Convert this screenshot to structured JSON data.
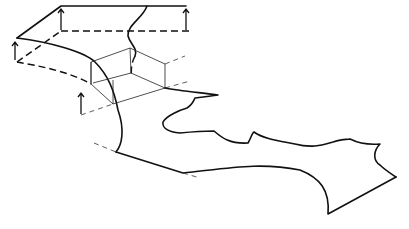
{
  "diagram": {
    "title": "",
    "stroke_color": "#111111",
    "background": "#ffffff",
    "elements": {
      "top_layer_outline": "M61,6 L186,6 M61,6 L17,38",
      "top_layer_dashed": "M61,31 L190,31 M17,62 L61,31",
      "front_edge_curve": "M17,38 C50,42 85,52 95,62 C108,75 114,90 118,110 C125,130 122,145 116,152",
      "front_edge_dashed": "M17,62 C40,66 70,72 91,84",
      "winding_river": "M147,6 C143,18 127,25 128,36 C130,44 138,48 135,56",
      "river_dashed": "M135,56 C130,66 132,70 131,74",
      "box_thin": "M91,62 L130,48 L165,64 L165,88 L113,104 L91,84 Z M91,62 L91,84 M130,48 L131,73 M131,73 L165,88 M131,73 L93,83 M113,104 L113,80",
      "box_extension_dashed": "M165,64 L185,56 M165,88 L190,81 M81,115 L113,104",
      "coast_upper": "M165,88 C180,91 205,93 218,95 C210,96 204,97 195,98 C193,102 192,105 187,108 C180,110 166,116 163,122 C162,128 168,132 180,133 C190,132 200,131 214,131 C222,138 230,144 248,143 C251,138 252,133 254,132 C262,138 275,140 295,144 C310,148 320,146 333,142 C345,138 345,140 350,139 C360,144 368,145 380,144 C374,150 372,160 380,165 C385,170 390,173 396,177",
      "coast_lower": "M116,152 L183,173 C230,168 260,162 300,170 C320,178 330,190 328,214 L396,177",
      "dashed_left_coast": "M94,143 L116,152",
      "dashed_right_coast": "M183,173 L200,178",
      "arrows": [
        {
          "x": 61,
          "y1": 30,
          "y2": 9
        },
        {
          "x": 186,
          "y1": 30,
          "y2": 9
        },
        {
          "x": 15,
          "y1": 60,
          "y2": 42
        },
        {
          "x": 81,
          "y1": 114,
          "y2": 93
        }
      ]
    }
  }
}
